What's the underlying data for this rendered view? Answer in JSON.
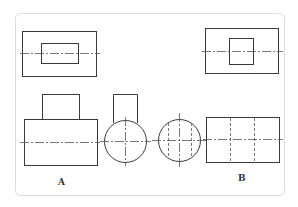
{
  "diagram": {
    "type": "orthographic-projection-views",
    "labels": {
      "a": "A",
      "b": "B"
    },
    "colors": {
      "line": "#3a3a3a",
      "frame": "#dcdcdc",
      "background": "#ffffff"
    }
  }
}
